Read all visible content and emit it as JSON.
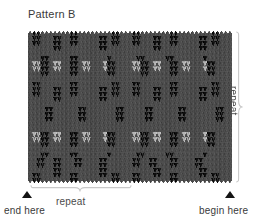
{
  "title": "Pattern B",
  "labels": {
    "repeat_vertical": "repeat",
    "repeat_horizontal": "repeat",
    "end_here": "end here",
    "begin_here": "begin here"
  },
  "colors": {
    "background": "#ffffff",
    "text": "#3a3a3a",
    "bracket": "#c9c9c9",
    "marker": "#141414",
    "yarn_main": "#4d4d4d",
    "yarn_dark": "#0d0d0d",
    "yarn_light": "#b4b4b4"
  },
  "chart_data": {
    "type": "heatmap",
    "title": "Pattern B",
    "xlabel": "",
    "ylabel": "",
    "stitch_width": 4.25,
    "stitch_height": 5.07,
    "columns": 48,
    "rows": 30,
    "repeat_columns": 24,
    "repeat_rows": 30,
    "legend": [
      {
        "key": "M",
        "name": "main-gray",
        "color": "#4d4d4d"
      },
      {
        "key": "D",
        "name": "dark-black",
        "color": "#0d0d0d"
      },
      {
        "key": "L",
        "name": "light-gray",
        "color": "#b4b4b4"
      }
    ],
    "grid": [
      "MDDMMMMMMMDDMMMMMMMMDDMMMDDMMMMMMMDDMMMMMMMMDDMMM",
      "MDDMMMDDMMDDMMMMMDDMDDMMMDDMMMDDMMDDMMMMMDDMDDMMM",
      "MDDMMMDDMMDDMMMMMDDMDDMMMDDMMMDDMMDDMMMMMDDMDDMMM",
      "MMMMMMDDMMMMMMMMMDDMMMMMMMMMMMDDMMMMMMMMMDDMMMMMM",
      "MMMMMMMMMMMMMMMMMMMMMMMMMMMMMMMMMMMMMMMMMMMMMMMM",
      "MMMDDMMMMMDDMMMMMMMDMMMMMMDDMMMMMDDMMMMMMMDMMMMMM",
      "MLLDDMLLMMDDMLLMMMLDDMMMMLLDDMLLMMDDMLLMMMLDDMMMM",
      "MLLDDMLLMMDDMLLMMMLDDMMMMLLDDMLLMMDDMLLMMMLDDMMMM",
      "MMMDDMMMMMDDMMMMMMMDDMMMMMMDDMMMMMDDMMMMMMMDDMMMM",
      "MMMMMMMMMMMMMMMMMMMMMMMMMMMMMMMMMMMMMMMMMMMMMMMM",
      "MDDMMMMMMMDDMMMMMMMMDDMMMDDMMMMMMMDDMMMMMMMMDDMMM",
      "MDDMMMDDMMDDMMMMMDDMDDMMMDDMMMDDMMDDMMMMMDDMDDMMM",
      "MDDMMMDDMMDDMMMMMDDMDDMMMDDMMMDDMMDDMMMMMDDMDDMMM",
      "MMMMMMDDMMMMMMMMMDDMMMMMMMMMMMDDMMMMMMMMMDDMMMMMM",
      "MMMMMMMMMMMMMMMMMMMMMMMMMMMMMMMMMMMMMMMMMMMMMMMM",
      "MMMMDDMMMMMMDDMMMMMMMDDMMMMMDDMMMMMMDDMMMMMMMDDMM",
      "MMMMDDMMMMMMDDMMMMMMMDDMMMMMDDMMMMMMDDMMMMMMMDDMM",
      "MMMMDDMMMMMMDDMMMMMMMDDMMMMMDDMMMMMMDDMMMMMMMDDMM",
      "MMMMMMMMMMMMMMMMMMMMMMMMMMMMMMMMMMMMMMMMMMMMMMMM",
      "MMMMMMMMMMMMMMMMMMMMMMMMMMMMMMMMMMMMMMMMMMMMMMMM",
      "MLLDDMLLMMDDMLLMMMLDDMMMMLLDDMLLMMDDMLLMMMLDDMMMM",
      "MLLDDMLLMMDDMLLMMMLDDMMMMLLDDMLLMMDDMLLMMMLDDMMMM",
      "MMMDDMMMMMDDMMMMMMMDDMMMMMMDDMMMMMDDMMMMMMMDDMMMM",
      "MMMMMMMMMMMMMMMMMMMMMMMMMMMMMMMMMMMMMMMMMMMMMMMM",
      "MMMDDMMMMMDDMMMMMMMDMMMMMMDDMMMMMDDMMMMMMMDMMMMMM",
      "MMDDMMDDMMMDDMMMMDDMMMMMMDDMMDDMMMDDMMMMDDMMMMMMM",
      "MMDDMMDDMMMDDMMMMDDMMMMMMDDMMDDMMMDDMMMMDDMMMMMMM",
      "MMMMMMDDMMMMMMMMMDDMMMMMMMMMMMDDMMMMMMMMMDDMMMMMM",
      "MDDMMMDDMMDDMMMMMDDMDDMMMDDMMMDDMMDDMMMMMDDMDDMMM",
      "MDDMMMMMMMDDMMMMMMMMDDMMMDDMMMMMMMDDMMMMMMMMDDMMM"
    ]
  }
}
